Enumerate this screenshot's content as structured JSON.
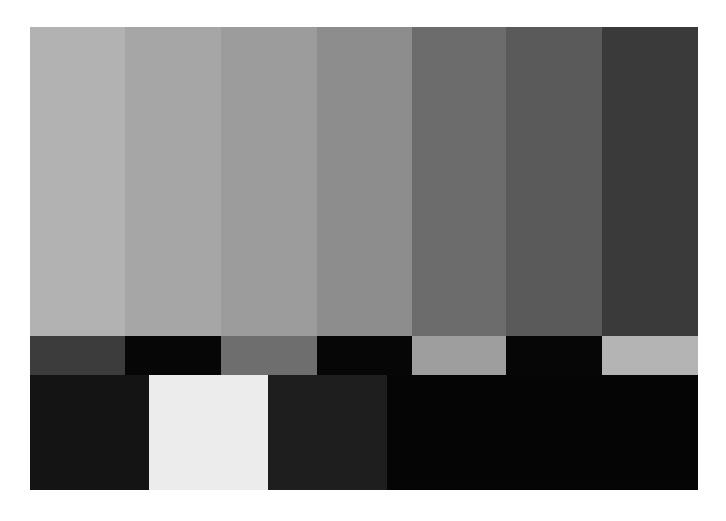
{
  "pattern": {
    "name": "grayscale bars test pattern",
    "top_bars": [
      {
        "label": "bar-1",
        "color": "#b2b2b2",
        "width": 95
      },
      {
        "label": "bar-2",
        "color": "#a6a6a6",
        "width": 96
      },
      {
        "label": "bar-3",
        "color": "#9c9c9c",
        "width": 96
      },
      {
        "label": "bar-4",
        "color": "#8d8d8d",
        "width": 95
      },
      {
        "label": "bar-5",
        "color": "#6c6c6c",
        "width": 94
      },
      {
        "label": "bar-6",
        "color": "#5a5a5a",
        "width": 96
      },
      {
        "label": "bar-7",
        "color": "#3a3a3a",
        "width": 96
      }
    ],
    "middle_bars": [
      {
        "label": "mid-1",
        "color": "#3c3c3c",
        "width": 95
      },
      {
        "label": "mid-2",
        "color": "#060606",
        "width": 96
      },
      {
        "label": "mid-3",
        "color": "#6e6e6e",
        "width": 96
      },
      {
        "label": "mid-4",
        "color": "#060606",
        "width": 95
      },
      {
        "label": "mid-5",
        "color": "#9e9e9e",
        "width": 94
      },
      {
        "label": "mid-6",
        "color": "#060606",
        "width": 96
      },
      {
        "label": "mid-7",
        "color": "#b4b4b4",
        "width": 96
      }
    ],
    "bottom_blocks": [
      {
        "label": "bottom-1",
        "color": "#141414",
        "width": 119
      },
      {
        "label": "bottom-2",
        "color": "#ececec",
        "width": 119
      },
      {
        "label": "bottom-3",
        "color": "#1e1e1e",
        "width": 119
      },
      {
        "label": "bottom-4",
        "color": "#050505",
        "width": 311
      }
    ]
  }
}
